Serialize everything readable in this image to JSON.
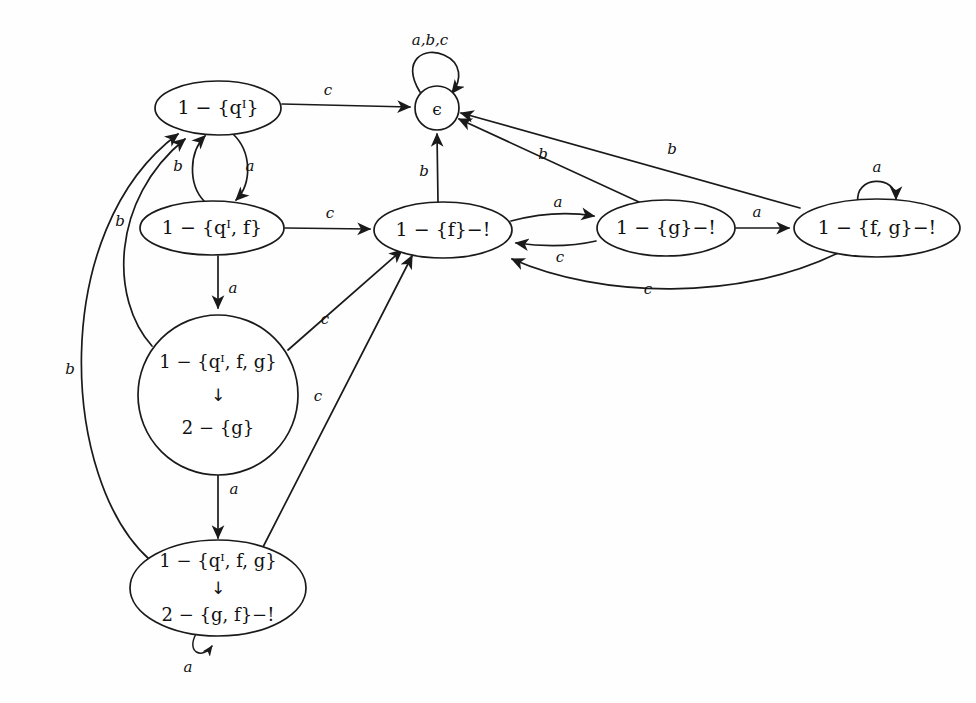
{
  "diagram": {
    "type": "state-transition-diagram",
    "background_color": "#fefefe",
    "stroke_color": "#1a1a1a"
  },
  "states": [
    {
      "id": "q_init",
      "shape": "ellipse",
      "label_lines": [
        "1 − {qᴵ}"
      ],
      "cx": 218,
      "cy": 108,
      "rx": 63,
      "ry": 27,
      "accepting": false
    },
    {
      "id": "epsilon",
      "shape": "circle",
      "label_lines": [
        "ϵ"
      ],
      "cx": 437,
      "cy": 108,
      "rx": 22,
      "ry": 22,
      "accepting": false
    },
    {
      "id": "q_init_f",
      "shape": "ellipse",
      "label_lines": [
        "1 − {qᴵ, f}"
      ],
      "cx": 212,
      "cy": 228,
      "rx": 72,
      "ry": 27,
      "accepting": false
    },
    {
      "id": "f_bang",
      "shape": "ellipse",
      "label_lines": [
        "1 − {f}−!"
      ],
      "cx": 443,
      "cy": 230,
      "rx": 69,
      "ry": 28,
      "accepting": true
    },
    {
      "id": "g_bang",
      "shape": "ellipse",
      "label_lines": [
        "1 − {g}−!"
      ],
      "cx": 666,
      "cy": 228,
      "rx": 69,
      "ry": 28,
      "accepting": true
    },
    {
      "id": "fg_bang",
      "shape": "ellipse",
      "label_lines": [
        "1 − {f, g}−!"
      ],
      "cx": 877,
      "cy": 228,
      "rx": 83,
      "ry": 29,
      "accepting": true
    },
    {
      "id": "q_init_f_g_to_g",
      "shape": "circle",
      "label_lines": [
        "1 − {qᴵ, f, g}",
        "↓",
        "2 − {g}"
      ],
      "cx": 218,
      "cy": 395,
      "rx": 80,
      "ry": 80,
      "accepting": false
    },
    {
      "id": "q_init_f_g_to_gf_bang",
      "shape": "ellipse",
      "label_lines": [
        "1 − {qᴵ, f, g}",
        "↓",
        "2 − {g, f}−!"
      ],
      "cx": 218,
      "cy": 588,
      "rx": 88,
      "ry": 48,
      "accepting": true
    }
  ],
  "transitions": [
    {
      "id": "t1",
      "from": "q_init",
      "to": "epsilon",
      "label": "c",
      "label_x": 328,
      "label_y": 97
    },
    {
      "id": "t2",
      "from": "epsilon",
      "to": "epsilon",
      "label": "a,b,c",
      "label_x": 430,
      "label_y": 41,
      "self_loop": true
    },
    {
      "id": "t3",
      "from": "q_init",
      "to": "q_init_f",
      "label": "a",
      "label_x": 243,
      "label_y": 168
    },
    {
      "id": "t4",
      "from": "q_init_f",
      "to": "q_init",
      "label": "b",
      "label_x": 180,
      "label_y": 168
    },
    {
      "id": "t5",
      "from": "q_init_f",
      "to": "f_bang",
      "label": "c",
      "label_x": 330,
      "label_y": 217
    },
    {
      "id": "t6",
      "from": "f_bang",
      "to": "epsilon",
      "label": "b",
      "label_x": 427,
      "label_y": 172
    },
    {
      "id": "t7",
      "from": "f_bang",
      "to": "g_bang",
      "label": "a",
      "label_x": 558,
      "label_y": 206
    },
    {
      "id": "t8",
      "from": "g_bang",
      "to": "f_bang",
      "label": "c",
      "label_x": 560,
      "label_y": 253
    },
    {
      "id": "t9",
      "from": "g_bang",
      "to": "epsilon",
      "label": "b",
      "label_x": 545,
      "label_y": 157
    },
    {
      "id": "t10",
      "from": "g_bang",
      "to": "fg_bang",
      "label": "a",
      "label_x": 756,
      "label_y": 213
    },
    {
      "id": "t11",
      "from": "fg_bang",
      "to": "epsilon",
      "label": "b",
      "label_x": 672,
      "label_y": 152
    },
    {
      "id": "t12",
      "from": "fg_bang",
      "to": "fg_bang",
      "label": "a",
      "label_x": 877,
      "label_y": 170,
      "self_loop": true
    },
    {
      "id": "t13",
      "from": "fg_bang",
      "to": "f_bang",
      "label": "c",
      "label_x": 648,
      "label_y": 286
    },
    {
      "id": "t14",
      "from": "q_init_f",
      "to": "q_init_f_g_to_g",
      "label": "a",
      "label_x": 232,
      "label_y": 290
    },
    {
      "id": "t15",
      "from": "q_init_f_g_to_g",
      "to": "f_bang",
      "label": "c",
      "label_x": 325,
      "label_y": 322
    },
    {
      "id": "t16",
      "from": "q_init_f_g_to_g",
      "to": "q_init",
      "label": "b",
      "label_x": 122,
      "label_y": 222
    },
    {
      "id": "t17",
      "from": "q_init_f_g_to_g",
      "to": "q_init_f_g_to_gf_bang",
      "label": "a",
      "label_x": 234,
      "label_y": 490
    },
    {
      "id": "t18",
      "from": "q_init_f_g_to_gf_bang",
      "to": "f_bang",
      "label": "c",
      "label_x": 318,
      "label_y": 397
    },
    {
      "id": "t19",
      "from": "q_init_f_g_to_gf_bang",
      "to": "q_init",
      "label": "b",
      "label_x": 72,
      "label_y": 370
    },
    {
      "id": "t20",
      "from": "q_init_f_g_to_gf_bang",
      "to": "q_init_f_g_to_gf_bang",
      "label": "a",
      "label_x": 208,
      "label_y": 672,
      "self_loop": true
    }
  ],
  "alphabet": [
    "a",
    "b",
    "c"
  ]
}
